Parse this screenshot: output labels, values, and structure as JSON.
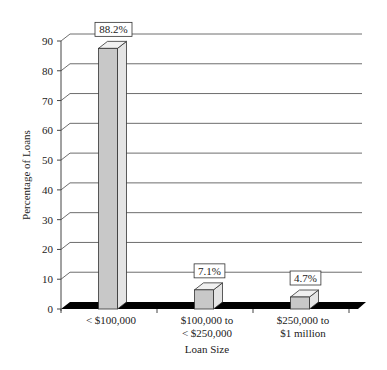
{
  "chart_data": {
    "type": "bar",
    "title": "",
    "xlabel": "Loan Size",
    "ylabel": "Percentage of Loans",
    "ylim": [
      0,
      90
    ],
    "yticks": [
      0,
      10,
      20,
      30,
      40,
      50,
      60,
      70,
      80,
      90
    ],
    "grid": true,
    "legend": null,
    "style": "3d-column",
    "categories": [
      [
        "< $100,000"
      ],
      [
        "$100,000 to",
        "< $250,000"
      ],
      [
        "$250,000 to",
        "$1 million"
      ]
    ],
    "category_labels": [
      "< $100,000",
      "$100,000 to < $250,000",
      "$250,000 to $1 million"
    ],
    "values": [
      88.2,
      7.1,
      4.7
    ],
    "data_labels": [
      "88.2%",
      "7.1%",
      "4.7%"
    ]
  },
  "colors": {
    "bar_front": "#c8c8c8",
    "bar_side": "#e4e4e4",
    "bar_top": "#f0f0f0",
    "bar_stroke": "#333333",
    "floor": "#000000",
    "grid": "#6e6e6e",
    "axis": "#444444"
  }
}
